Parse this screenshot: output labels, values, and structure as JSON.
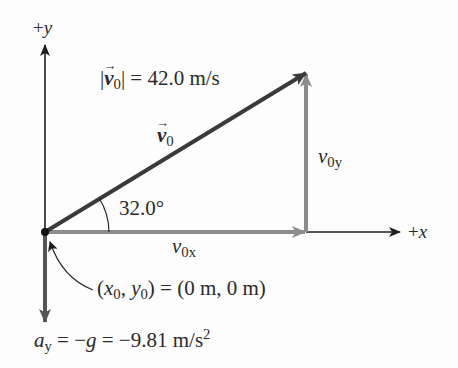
{
  "diagram": {
    "type": "vector-components",
    "axes": {
      "x_label_sign": "+",
      "x_label_var": "x",
      "y_label_sign": "+",
      "y_label_var": "y"
    },
    "velocity": {
      "magnitude_label_prefix": "|",
      "magnitude_symbol": "v",
      "magnitude_subscript": "0",
      "magnitude_label_suffix": "| = 42.0 m/s",
      "magnitude_value": 42.0,
      "magnitude_unit": "m/s",
      "vector_symbol": "v",
      "vector_subscript": "0",
      "arrow_glyph": "→"
    },
    "angle": {
      "label": "32.0°",
      "value_deg": 32.0
    },
    "components": {
      "x_symbol": "v",
      "x_subscript": "0x",
      "y_symbol": "v",
      "y_subscript": "0y"
    },
    "origin": {
      "label_open": "(",
      "x_sym": "x",
      "x_sub": "0",
      "comma": ", ",
      "y_sym": "y",
      "y_sub": "0",
      "label_rest": ") = (0 m, 0 m)"
    },
    "acceleration": {
      "symbol": "a",
      "subscript": "y",
      "eq1": " = −",
      "g_sym": "g",
      "eq2": " = −9.81 m/s",
      "sup": "2",
      "value": -9.81,
      "unit": "m/s²"
    },
    "colors": {
      "axis": "#1e1e1e",
      "vector": "#3a3a3a",
      "component": "#8c8c8c",
      "text": "#2a2a2a"
    }
  }
}
